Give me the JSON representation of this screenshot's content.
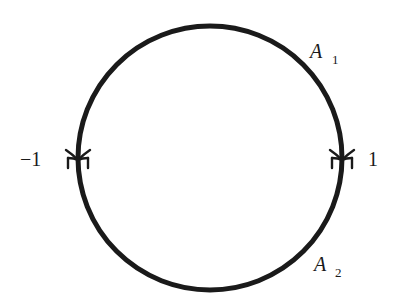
{
  "diagram": {
    "type": "unit-circle-contour",
    "circle": {
      "cx": 210,
      "cy": 158,
      "r": 132,
      "stroke": "#1a1a1a",
      "stroke_width": 5
    },
    "points": [
      {
        "id": "minus-one",
        "label": "−1",
        "x": 78,
        "y": 158
      },
      {
        "id": "plus-one",
        "label": "1",
        "x": 342,
        "y": 158
      }
    ],
    "arcs": [
      {
        "id": "A1",
        "label_main": "A",
        "label_sub": "1",
        "position": "upper-right"
      },
      {
        "id": "A2",
        "label_main": "A",
        "label_sub": "2",
        "position": "lower-right"
      }
    ]
  }
}
